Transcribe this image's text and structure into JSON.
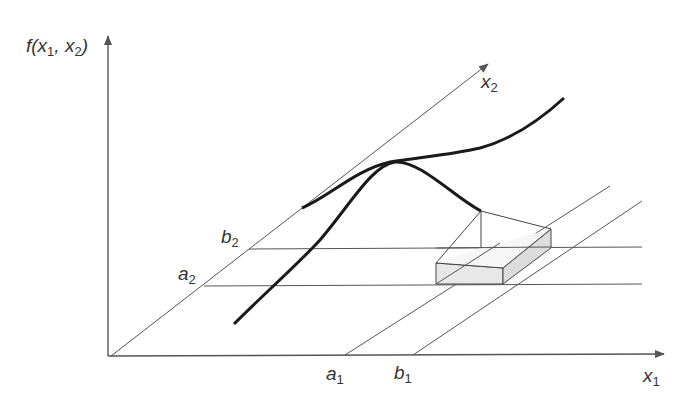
{
  "diagram": {
    "colors": {
      "axis": "#555555",
      "curve": "#1a1a1a",
      "thin": "#555555",
      "box_fill": "#e6e6e6",
      "label": "#333333"
    },
    "labels": {
      "f_axis": {
        "base": "f(x",
        "sub1": "1",
        "mid": ", x",
        "sub2": "2",
        "end": ")"
      },
      "x1_axis": {
        "base": "x",
        "sub": "1"
      },
      "x2_axis": {
        "base": "x",
        "sub": "2"
      },
      "a1": {
        "base": "a",
        "sub": "1"
      },
      "b1": {
        "base": "b",
        "sub": "1"
      },
      "a2": {
        "base": "a",
        "sub": "2"
      },
      "b2": {
        "base": "b",
        "sub": "2"
      }
    },
    "origin": [
      111,
      356
    ],
    "f_axis_end": [
      108,
      38
    ],
    "x1_axis_end": [
      662,
      354
    ],
    "x2_axis_end": [
      486,
      66
    ],
    "lines": {
      "b2_h": [
        [
          249,
          249
        ],
        [
          642,
          247
        ]
      ],
      "a2_h": [
        [
          204,
          286
        ],
        [
          642,
          284
        ]
      ],
      "a1_diag": [
        [
          345,
          355
        ],
        [
          610,
          186
        ]
      ],
      "b1_diag": [
        [
          413,
          355
        ],
        [
          642,
          201
        ]
      ],
      "b2_diag_up": [
        [
          249,
          249
        ],
        [
          302,
          208
        ]
      ]
    },
    "curves": {
      "front": "M234,324 C262,296 300,262 320,240 C350,205 372,165 395,162 C420,160 455,198 481,211",
      "back": "M302,208 C330,196 355,170 390,162 C420,157 450,155 480,148 C510,140 540,120 564,98"
    },
    "box": {
      "peak": [
        481,
        211
      ],
      "tfl": [
        436,
        263
      ],
      "bfl": [
        436,
        284
      ],
      "tfr": [
        503,
        268
      ],
      "bfr": [
        503,
        284
      ],
      "tbr": [
        551,
        229
      ],
      "bbr": [
        551,
        248
      ],
      "peak_base": [
        481,
        248
      ]
    }
  }
}
